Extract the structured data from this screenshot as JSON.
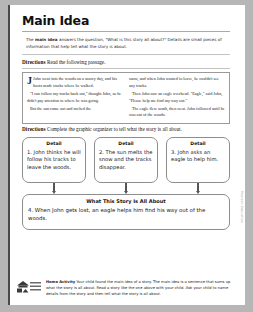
{
  "worksheet": {
    "title": "Main Idea",
    "definition_prefix": "The ",
    "definition_bold": "main idea",
    "definition_rest": " answers the question, \"What is this story all about?\" Details are small pieces of information that help tell what the story is about.",
    "directions_label": "Directions",
    "directions_read": "Read the following passage.",
    "directions_organizer_label": "Directions",
    "directions_organizer": "Complete the graphic organizer to tell what the story is all about."
  },
  "passage": {
    "left_column": [
      "John went into the woods on a snowy day, and his boots made tracks where he walked.",
      "\"I can follow my tracks back out,\" thought John, so he didn't pay attention to where he was going.",
      "But the sun came out and melted the"
    ],
    "right_column": [
      "snow, and when John wanted to leave, he couldn't see any tracks.",
      "Then John saw an eagle overhead. \"Eagle,\" said John, \"Please help me find my way out.\"",
      "The eagle flew south, then west. John followed until he was out of the woods."
    ],
    "dropcap": "J"
  },
  "organizer": {
    "detail_label": "Detail",
    "details": [
      "1. John thinks he will follow his tracks to leave the woods.",
      "2. The sun melts the snow and the tracks disappear.",
      "3. John asks an eagle to help him."
    ],
    "summary_title": "What This Story Is All About",
    "summary_text": "4. When John gets lost, an eagle helps him find his way out of the woods."
  },
  "footer": {
    "logo_line1": "School",
    "logo_line2": "Home",
    "activity_label": "Home Activity",
    "activity_text": "Your child found the main idea of a story. The main idea is a sentence that sums up what the story is all about. Read a story like the one above with your child. Ask your child to name details from the story and then tell what the story is all about.",
    "copyright": "Pearson Education"
  }
}
